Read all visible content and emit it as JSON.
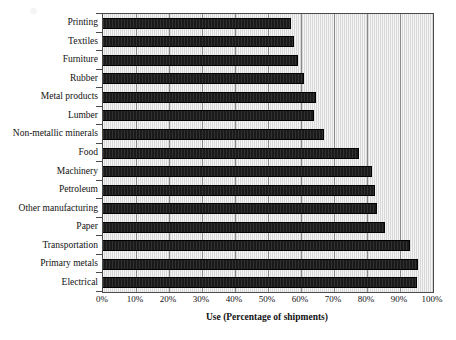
{
  "chart_data": {
    "type": "bar",
    "orientation": "horizontal",
    "title": "",
    "xlabel": "Use (Percentage of shipments)",
    "ylabel": "",
    "xlim": [
      0,
      100
    ],
    "xticks": [
      "0%",
      "10%",
      "20%",
      "30%",
      "40%",
      "50%",
      "60%",
      "70%",
      "80%",
      "90%",
      "100%"
    ],
    "xtick_values": [
      0,
      10,
      20,
      30,
      40,
      50,
      60,
      70,
      80,
      90,
      100
    ],
    "grid": true,
    "legend": false,
    "categories": [
      "Printing",
      "Textiles",
      "Furniture",
      "Rubber",
      "Metal products",
      "Lumber",
      "Non-metallic minerals",
      "Food",
      "Machinery",
      "Petroleum",
      "Other manufacturing",
      "Paper",
      "Transportation",
      "Primary metals",
      "Electrical"
    ],
    "values": [
      57,
      58,
      59,
      61,
      64.5,
      64,
      67,
      77.5,
      81.5,
      82.5,
      83,
      85.5,
      93,
      95.5,
      95
    ],
    "bar_color": "#1a1a1a",
    "plot_background": "#e8e8e8",
    "frame_color": "#4a4a4a"
  }
}
